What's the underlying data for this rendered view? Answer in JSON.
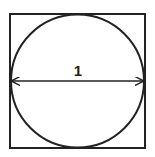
{
  "diagram": {
    "shapes": [
      {
        "type": "square",
        "side": 1
      },
      {
        "type": "circle",
        "diameter": 1,
        "inscribed": true
      }
    ],
    "dimension": {
      "label": "1",
      "measures": "circle diameter",
      "arrow": "double-headed horizontal"
    }
  },
  "colors": {
    "stroke": "#222222",
    "background": "#ffffff"
  }
}
